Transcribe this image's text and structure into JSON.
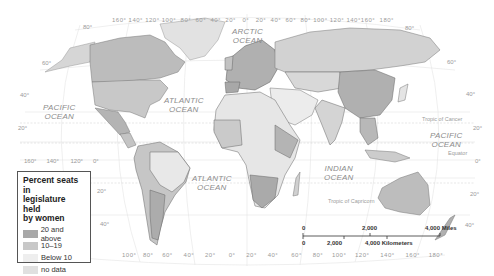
{
  "map": {
    "type": "world choropleth",
    "colors": {
      "20_and_above": "#a8a8a8",
      "10_19": "#c8c8c8",
      "below_10": "#e8e8e8",
      "no_data": "#dcdcdc",
      "ocean": "#ffffff",
      "graticule": "#e6e6e6",
      "border": "#666666"
    },
    "oceans": [
      {
        "name": "ARCTIC OCEAN",
        "line1": "ARCTIC",
        "line2": "OCEAN"
      },
      {
        "name": "PACIFIC OCEAN (west)",
        "line1": "PACIFIC",
        "line2": "OCEAN"
      },
      {
        "name": "ATLANTIC OCEAN (north)",
        "line1": "ATLANTIC",
        "line2": "OCEAN"
      },
      {
        "name": "ATLANTIC OCEAN (south)",
        "line1": "ATLANTIC",
        "line2": "OCEAN"
      },
      {
        "name": "INDIAN OCEAN",
        "line1": "INDIAN",
        "line2": "OCEAN"
      },
      {
        "name": "PACIFIC OCEAN (east)",
        "line1": "PACIFIC",
        "line2": "OCEAN"
      }
    ],
    "reference_lines": {
      "tropic_cancer": "Tropic of Cancer",
      "equator": "Equator",
      "tropic_capricorn": "Tropic of Capricorn"
    },
    "top_longitudes": [
      "160°",
      "140°",
      "120°",
      "100°",
      "80°",
      "60°",
      "40°",
      "20°",
      "0°",
      "20°",
      "40°",
      "60°",
      "80°",
      "100°",
      "120°",
      "140°",
      "160°",
      "180°"
    ],
    "bottom_longitudes": [
      "100°",
      "80°",
      "60°",
      "40°",
      "20°",
      "0°",
      "20°",
      "40°",
      "60°",
      "80°",
      "100°",
      "120°",
      "140°",
      "160°",
      "180°"
    ],
    "left_mid_longitudes": [
      "160°",
      "140°",
      "120°",
      "0°"
    ],
    "latitudes_left": [
      "80°",
      "60°",
      "40°",
      "20°",
      "20°",
      "40°"
    ],
    "latitudes_right": [
      "80°",
      "60°",
      "40°",
      "20°",
      "0°",
      "20°",
      "40°"
    ]
  },
  "legend": {
    "title": "Percent seats in legislature held by women",
    "title_lines": [
      "Percent seats in",
      "legislature held",
      "by women"
    ],
    "items": [
      {
        "label": "20 and above",
        "color": "#a8a8a8"
      },
      {
        "label": "10–19",
        "color": "#c8c8c8"
      },
      {
        "label": "Below 10",
        "color": "#eeeeee"
      },
      {
        "label": "no data",
        "color": "#e0e0e0"
      }
    ]
  },
  "scale_bar": {
    "miles": {
      "zero": "0",
      "mid": "2,000",
      "end": "4,000 Miles"
    },
    "km": {
      "zero": "0",
      "mid": "2,000",
      "end": "4,000 Kilometers"
    }
  }
}
